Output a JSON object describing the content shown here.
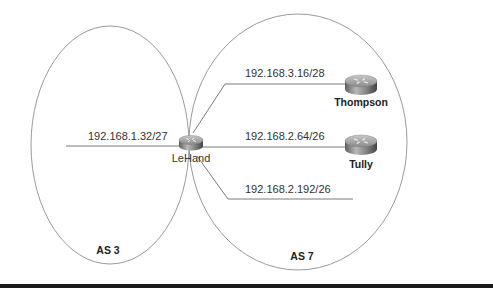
{
  "diagram": {
    "type": "network-topology",
    "autonomous_systems": [
      {
        "id": "as3",
        "label": "AS 3"
      },
      {
        "id": "as7",
        "label": "AS 7"
      }
    ],
    "routers": [
      {
        "id": "lehand",
        "label": "LeHand",
        "icon": "router-icon"
      },
      {
        "id": "thompson",
        "label": "Thompson",
        "icon": "router-icon"
      },
      {
        "id": "tully",
        "label": "Tully",
        "icon": "router-icon"
      }
    ],
    "networks": [
      {
        "id": "net1",
        "label": "192.168.1.32/27"
      },
      {
        "id": "net2",
        "label": "192.168.3.16/28"
      },
      {
        "id": "net3",
        "label": "192.168.2.64/26"
      },
      {
        "id": "net4",
        "label": "192.168.2.192/26"
      }
    ],
    "colors": {
      "outline": "#9a9a9a",
      "line": "#7a7a7a",
      "router_body": "#8c8c8c",
      "bottom_rule": "#1a1a1a"
    }
  }
}
